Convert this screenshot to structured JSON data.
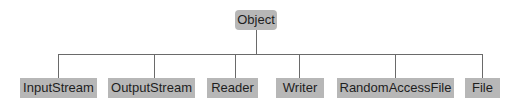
{
  "diagram": {
    "root": {
      "label": "Object",
      "x": 235,
      "y": 10,
      "w": 42
    },
    "children": [
      {
        "label": "InputStream",
        "x": 20,
        "w": 77
      },
      {
        "label": "OutputStream",
        "x": 108,
        "w": 87
      },
      {
        "label": "Reader",
        "x": 207,
        "w": 51
      },
      {
        "label": "Writer",
        "x": 276,
        "w": 48
      },
      {
        "label": "RandomAccessFile",
        "x": 337,
        "w": 117
      },
      {
        "label": "File",
        "x": 465,
        "w": 35
      }
    ],
    "children_y": 78,
    "bus_y": 54,
    "colors": {
      "box": "#b7b7b7",
      "line": "#6a6a6a",
      "text": "#1e1e1e"
    }
  }
}
